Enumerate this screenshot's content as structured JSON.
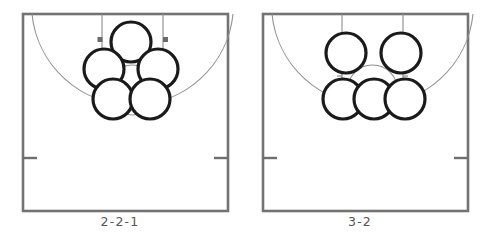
{
  "figure": {
    "kind": "basketball-formation-diagrams",
    "panel_count": 2
  },
  "colors": {
    "background": "#ffffff",
    "court_line": "#6e6e6e",
    "court_line_dark": "#7a7a7a",
    "thin_line": "#8a8a8a",
    "arc_line": "#8d8d8d",
    "player_outline": "#1a1a1a",
    "player_fill": "#ffffff",
    "label_text": "#555555",
    "block_mark": "#6b6b6b"
  },
  "panels": [
    {
      "id": "panel-left",
      "label": "2-2-1",
      "formation": "2-2-1",
      "player_count": 5,
      "rows": [
        1,
        2,
        2
      ],
      "players": [
        {
          "id": "p1",
          "cx": 131,
          "cy": 42,
          "r": 20,
          "row": "top",
          "slot": 1
        },
        {
          "id": "p2",
          "cx": 104,
          "cy": 69,
          "r": 20,
          "row": "middle",
          "slot": 1
        },
        {
          "id": "p3",
          "cx": 158,
          "cy": 69,
          "r": 20,
          "row": "middle",
          "slot": 2
        },
        {
          "id": "p4",
          "cx": 113,
          "cy": 99,
          "r": 20,
          "row": "bottom",
          "slot": 1
        },
        {
          "id": "p5",
          "cx": 150,
          "cy": 99,
          "r": 20,
          "row": "bottom",
          "slot": 2
        }
      ]
    },
    {
      "id": "panel-right",
      "label": "3-2",
      "formation": "3-2",
      "player_count": 5,
      "rows": [
        2,
        3
      ],
      "players": [
        {
          "id": "p1",
          "cx": 106,
          "cy": 53,
          "r": 20,
          "row": "top",
          "slot": 1
        },
        {
          "id": "p2",
          "cx": 161,
          "cy": 53,
          "r": 20,
          "row": "top",
          "slot": 2
        },
        {
          "id": "p3",
          "cx": 103,
          "cy": 99,
          "r": 20,
          "row": "bottom",
          "slot": 1
        },
        {
          "id": "p4",
          "cx": 134,
          "cy": 99,
          "r": 20,
          "row": "bottom",
          "slot": 2
        },
        {
          "id": "p5",
          "cx": 165,
          "cy": 99,
          "r": 20,
          "row": "bottom",
          "slot": 3
        }
      ]
    }
  ],
  "court": {
    "boundary": {
      "x": 23,
      "y": 14,
      "width": 205,
      "height": 197
    },
    "lane": {
      "left": 102,
      "right": 163,
      "top": 14,
      "free_throw_y": 90
    },
    "free_throw_circle": {
      "cx": 132.5,
      "cy": 90,
      "r": 25
    },
    "three_point_arc": {
      "center_x": 132.5,
      "center_y": 14,
      "radius": 101,
      "description": "semicircular arc from left baseline to right baseline"
    },
    "lane_blocks": [
      {
        "x": 99,
        "y": 39
      },
      {
        "x": 161,
        "y": 39
      }
    ],
    "lane_hash_marks": [
      {
        "side": "left",
        "y": 58
      },
      {
        "side": "left",
        "y": 76
      },
      {
        "side": "right",
        "y": 58
      },
      {
        "side": "right",
        "y": 76
      }
    ],
    "sideline_hash_marks": [
      {
        "side": "left",
        "x": 23,
        "y": 158,
        "length": 14
      },
      {
        "side": "right",
        "x": 228,
        "y": 158,
        "length": 14
      }
    ]
  }
}
